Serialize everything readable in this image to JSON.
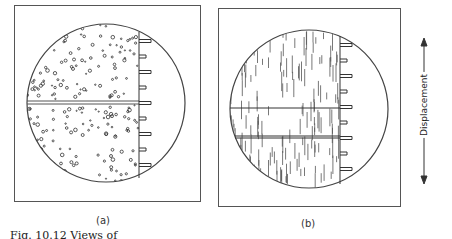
{
  "figure": {
    "panels": [
      {
        "id": "a",
        "label": "(a)",
        "fill": "dots",
        "description": "Circular field of view with speckled (dot) pattern, horizontal double hairline across center, graduated scale along right edge"
      },
      {
        "id": "b",
        "label": "(b)",
        "fill": "vertical-lines",
        "description": "Circular field of view with vertical line pattern, two horizontal hairlines, graduated scale along right edge"
      }
    ],
    "axis": {
      "label": "Displacement",
      "direction": "vertical-double-arrow"
    },
    "caption": "Fig. 10.12   Views of"
  }
}
